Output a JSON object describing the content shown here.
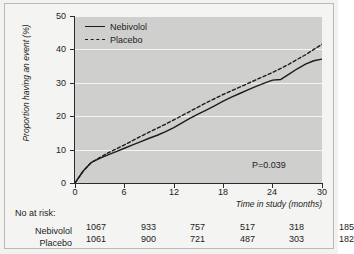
{
  "chart_data": {
    "type": "line",
    "title": "",
    "xlabel": "Time in study (months)",
    "ylabel": "Proportion having an event (%)",
    "xlim": [
      0,
      30
    ],
    "ylim": [
      0,
      50
    ],
    "xticks": [
      "0",
      "6",
      "12",
      "18",
      "24",
      "30"
    ],
    "yticks": [
      "0",
      "10",
      "20",
      "30",
      "40",
      "50"
    ],
    "grid": "horizontal",
    "legend_position": "top-left",
    "annotation": "P=0.039",
    "series": [
      {
        "name": "Nebivolol",
        "style": "solid",
        "color": "#1c1c1c",
        "x": [
          0,
          1,
          2,
          3,
          4,
          5,
          6,
          7,
          8,
          9,
          10,
          11,
          12,
          13,
          14,
          15,
          16,
          17,
          18,
          19,
          20,
          21,
          22,
          23,
          24,
          25,
          26,
          27,
          28,
          29,
          30
        ],
        "values": [
          0,
          3.6,
          6.2,
          7.4,
          8.4,
          9.4,
          10.4,
          11.4,
          12.4,
          13.4,
          14.3,
          15.4,
          16.6,
          18.0,
          19.4,
          20.7,
          21.9,
          23.2,
          24.5,
          25.7,
          26.8,
          27.9,
          28.9,
          29.9,
          30.8,
          31.0,
          32.6,
          34.2,
          35.6,
          36.6,
          37.1
        ]
      },
      {
        "name": "Placebo",
        "style": "dashed",
        "color": "#1c1c1c",
        "x": [
          0,
          1,
          2,
          3,
          4,
          5,
          6,
          7,
          8,
          9,
          10,
          11,
          12,
          13,
          14,
          15,
          16,
          17,
          18,
          19,
          20,
          21,
          22,
          23,
          24,
          25,
          26,
          27,
          28,
          29,
          30
        ],
        "values": [
          0,
          3.6,
          6.2,
          7.6,
          9.0,
          10.2,
          11.4,
          12.7,
          14.0,
          15.2,
          16.4,
          17.6,
          18.9,
          20.2,
          21.5,
          22.8,
          24.1,
          25.3,
          26.5,
          27.6,
          28.7,
          29.8,
          30.9,
          32.0,
          33.1,
          34.3,
          35.6,
          37.0,
          38.4,
          40.0,
          41.5
        ]
      }
    ]
  },
  "legend": {
    "items": [
      {
        "label": "Nebivolol",
        "style": "solid"
      },
      {
        "label": "Placebo",
        "style": "dashed"
      }
    ]
  },
  "axes": {
    "y_title": "Proportion having an event (%)",
    "x_title": "Time in study (months)",
    "y_ticks": [
      "50",
      "40",
      "30",
      "20",
      "10",
      "0"
    ],
    "x_ticks": [
      "0",
      "6",
      "12",
      "18",
      "24",
      "30"
    ]
  },
  "annotation": {
    "p_value": "P=0.039"
  },
  "risk_table": {
    "title": "No at risk:",
    "rows": [
      {
        "name": "Nebivolol",
        "counts": [
          "1067",
          "933",
          "757",
          "517",
          "318",
          "185"
        ]
      },
      {
        "name": "Placebo",
        "counts": [
          "1061",
          "900",
          "721",
          "487",
          "303",
          "182"
        ]
      }
    ]
  }
}
